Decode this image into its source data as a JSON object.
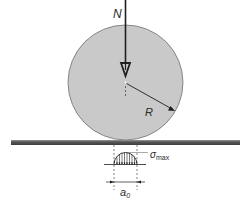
{
  "diagram": {
    "labels": {
      "load": "N",
      "radius": "R",
      "sigma": "σ",
      "sigma_sub": "max",
      "width": "a",
      "width_sub": "0"
    },
    "colors": {
      "cylinder_fill": "#c8c8c8",
      "cylinder_stroke": "#6a6a6a",
      "ground_dark": "#3c3c3c",
      "ground_light": "#8c8c8c",
      "line": "#1e1e1e"
    }
  }
}
